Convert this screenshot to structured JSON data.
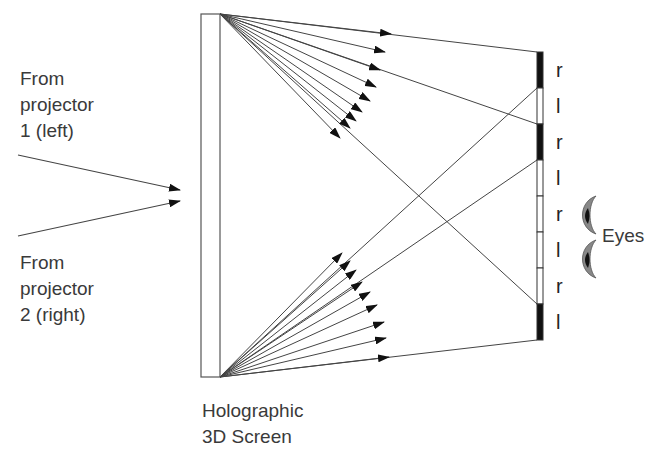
{
  "labels": {
    "projector1": [
      "From",
      "projector",
      "1 (left)"
    ],
    "projector2": [
      "From",
      "projector",
      "2 (right)"
    ],
    "screen": [
      "Holographic",
      "3D Screen"
    ],
    "eyes": "Eyes"
  },
  "barrier_labels": [
    "r",
    "l",
    "r",
    "l",
    "r",
    "l",
    "r",
    "l"
  ],
  "barrier_segments": [
    {
      "fill": "black"
    },
    {
      "fill": "white"
    },
    {
      "fill": "black"
    },
    {
      "fill": "white"
    },
    {
      "fill": "white"
    },
    {
      "fill": "white"
    },
    {
      "fill": "white"
    },
    {
      "fill": "black"
    }
  ],
  "colors": {
    "line": "#444444",
    "arrow": "#111111",
    "barrier_dark": "#111111"
  }
}
